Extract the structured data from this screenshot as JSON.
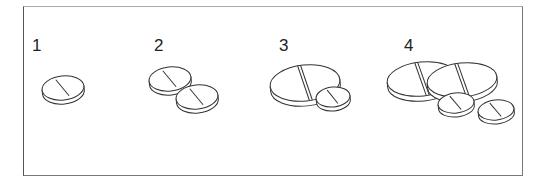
{
  "figure": {
    "stroke_color": "#333333",
    "groups": [
      {
        "label": "1",
        "label_pos": [
          32,
          37
        ],
        "tablets": [
          {
            "size": "small",
            "cx": 63,
            "cy": 88,
            "rx": 21,
            "ry": 12,
            "score": "single"
          }
        ]
      },
      {
        "label": "2",
        "label_pos": [
          154,
          37
        ],
        "tablets": [
          {
            "size": "small",
            "cx": 170,
            "cy": 79,
            "rx": 21,
            "ry": 12,
            "score": "single"
          },
          {
            "size": "small",
            "cx": 197,
            "cy": 97,
            "rx": 21,
            "ry": 12,
            "score": "single"
          }
        ]
      },
      {
        "label": "3",
        "label_pos": [
          279,
          37
        ],
        "tablets": [
          {
            "size": "large",
            "cx": 305,
            "cy": 83,
            "rx": 35,
            "ry": 18,
            "score": "double"
          },
          {
            "size": "small",
            "cx": 333,
            "cy": 97,
            "rx": 17,
            "ry": 10,
            "score": "single"
          }
        ]
      },
      {
        "label": "4",
        "label_pos": [
          404,
          37
        ],
        "tablets": [
          {
            "size": "large",
            "cx": 422,
            "cy": 79,
            "rx": 35,
            "ry": 17,
            "score": "double"
          },
          {
            "size": "large",
            "cx": 462,
            "cy": 80,
            "rx": 35,
            "ry": 17,
            "score": "double"
          },
          {
            "size": "small",
            "cx": 456,
            "cy": 103,
            "rx": 18,
            "ry": 10,
            "score": "single"
          },
          {
            "size": "small",
            "cx": 496,
            "cy": 110,
            "rx": 18,
            "ry": 10,
            "score": "single"
          }
        ]
      }
    ]
  }
}
